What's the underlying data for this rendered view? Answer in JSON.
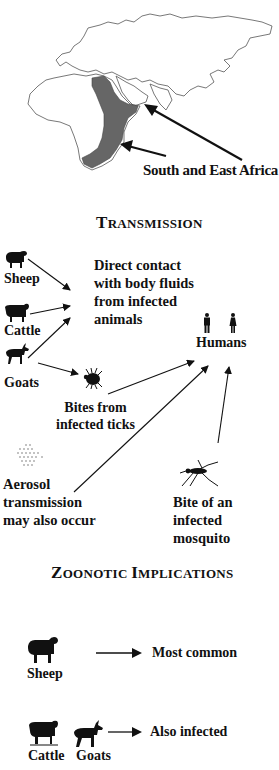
{
  "map": {
    "region_label": "South and East Africa",
    "highlight_color": "#666666",
    "outline_color": "#555555"
  },
  "transmission": {
    "title_first": "T",
    "title_rest": "RANSMISSION",
    "animals": [
      {
        "name": "Sheep",
        "icon": "sheep-icon"
      },
      {
        "name": "Cattle",
        "icon": "cattle-icon"
      },
      {
        "name": "Goats",
        "icon": "goat-icon"
      }
    ],
    "direct_contact": "Direct contact\nwith body fluids\nfrom infected\nanimals",
    "humans": "Humans",
    "ticks": "Bites from\ninfected ticks",
    "aerosol": "Aerosol\ntransmission\nmay also occur",
    "mosquito": "Bite of an\ninfected\nmosquito"
  },
  "zoonotic": {
    "title_z": "Z",
    "title_z_rest": "OONOTIC",
    "title_i": "I",
    "title_i_rest": "MPLICATIONS",
    "rows": [
      {
        "animals": [
          "Sheep"
        ],
        "result": "Most common"
      },
      {
        "animals": [
          "Cattle",
          "Goats"
        ],
        "result": "Also infected"
      }
    ]
  }
}
